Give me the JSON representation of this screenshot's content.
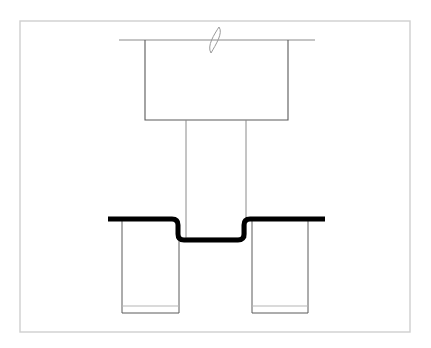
{
  "page": {
    "width": 431,
    "height": 348,
    "background_color": "#ffffff"
  },
  "colors": {
    "frame_stroke": "#cfcfcf",
    "thin_line": "#6f6f6f",
    "light_line": "#b5b5b5",
    "heavy_line": "#000000",
    "break_symbol": "#9a9a9a",
    "background": "#ffffff"
  },
  "frame": {
    "label": "drawing-border",
    "x": 20,
    "y": 21,
    "width": 390,
    "height": 311,
    "stroke": "#cfcfcf",
    "stroke_width": 1.4
  },
  "geometry": {
    "datum_line": {
      "label": "top-datum-line",
      "x1": 119,
      "x2": 315,
      "y": 40,
      "stroke": "#8a8a8a",
      "stroke_width": 1
    },
    "break_symbol": {
      "label": "break-symbol",
      "center_x": 215,
      "center_y": 40,
      "height": 26,
      "width": 9,
      "stroke": "#9a9a9a",
      "stroke_width": 1
    },
    "head_block": {
      "label": "fastener-head",
      "left": 145,
      "right": 288,
      "top": 40,
      "bottom": 120,
      "stroke": "#5a5a5a",
      "stroke_width": 1.1
    },
    "shank": {
      "label": "fastener-shank",
      "left": 186,
      "right": 246,
      "top": 120,
      "bottom": 238,
      "stroke": "#8a8a8a",
      "stroke_width": 1
    },
    "shank_base_line": {
      "label": "shank-base-line",
      "x1": 186,
      "x2": 246,
      "y": 238,
      "stroke": "#b5b5b5",
      "stroke_width": 1
    },
    "sheet_panel": {
      "label": "formed-sheet-panel",
      "left_end_x": 108,
      "right_end_x": 325,
      "upper_y": 219,
      "lower_y": 240,
      "left_bend_start_x": 178,
      "left_bend_end_x": 190,
      "right_bend_start_x": 244,
      "right_bend_end_x": 256,
      "corner_radius": 6,
      "stroke": "#000000",
      "stroke_width": 5
    },
    "left_pillar": {
      "label": "left-support-pillar",
      "left": 122,
      "right": 179,
      "top": 221,
      "bottom": 313,
      "inner_line_y": 306,
      "stroke": "#5a5a5a",
      "stroke_width": 1
    },
    "right_pillar": {
      "label": "right-support-pillar",
      "left": 252,
      "right": 308,
      "top": 221,
      "bottom": 313,
      "inner_line_y": 306,
      "stroke": "#5a5a5a",
      "stroke_width": 1
    }
  }
}
